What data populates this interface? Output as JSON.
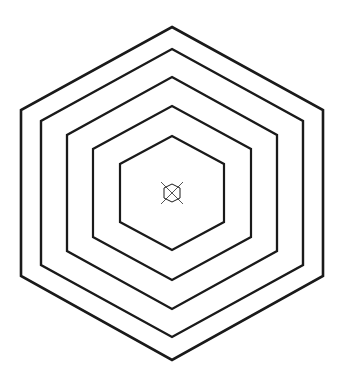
{
  "figure": {
    "background_color": "#ffffff",
    "stroke_color": "#1a1a1a",
    "marker_stroke_color": "#555555",
    "width": 345,
    "height": 387,
    "center": {
      "x": 172,
      "y": 193
    }
  },
  "chart_data": {
    "type": "line",
    "subtitle": "",
    "xlabel": "",
    "ylabel": "",
    "grid": false,
    "legend_position": "none",
    "xlim": [
      0,
      345
    ],
    "ylim": [
      0,
      387
    ],
    "center": {
      "x": 172,
      "y": 193
    },
    "shape": "hexagon",
    "orientation": "pointy-top",
    "ring_count": 5,
    "stroke_width": 2.2,
    "rings": [
      {
        "name": "ring-1-outermost",
        "index": 1,
        "half_width": 151,
        "half_height": 166,
        "stroke_width": 2.6,
        "vertices": [
          {
            "x": 172,
            "y": 27
          },
          {
            "x": 323,
            "y": 110
          },
          {
            "x": 323,
            "y": 276
          },
          {
            "x": 172,
            "y": 360
          },
          {
            "x": 21,
            "y": 276
          },
          {
            "x": 21,
            "y": 110
          }
        ]
      },
      {
        "name": "ring-2",
        "index": 2,
        "half_width": 131,
        "half_height": 144,
        "stroke_width": 2.4,
        "vertices": [
          {
            "x": 172,
            "y": 49
          },
          {
            "x": 303,
            "y": 121
          },
          {
            "x": 303,
            "y": 265
          },
          {
            "x": 172,
            "y": 337
          },
          {
            "x": 41,
            "y": 265
          },
          {
            "x": 41,
            "y": 121
          }
        ]
      },
      {
        "name": "ring-3",
        "index": 3,
        "half_width": 105,
        "half_height": 116,
        "stroke_width": 2.3,
        "vertices": [
          {
            "x": 172,
            "y": 77
          },
          {
            "x": 277,
            "y": 135
          },
          {
            "x": 277,
            "y": 251
          },
          {
            "x": 172,
            "y": 309
          },
          {
            "x": 67,
            "y": 251
          },
          {
            "x": 67,
            "y": 135
          }
        ]
      },
      {
        "name": "ring-4",
        "index": 4,
        "half_width": 79,
        "half_height": 87,
        "stroke_width": 2.2,
        "vertices": [
          {
            "x": 172,
            "y": 106
          },
          {
            "x": 251,
            "y": 149
          },
          {
            "x": 251,
            "y": 237
          },
          {
            "x": 172,
            "y": 280
          },
          {
            "x": 93,
            "y": 237
          },
          {
            "x": 93,
            "y": 149
          }
        ]
      },
      {
        "name": "ring-5-innermost",
        "index": 5,
        "half_width": 52,
        "half_height": 57,
        "stroke_width": 2.2,
        "vertices": [
          {
            "x": 172,
            "y": 136
          },
          {
            "x": 224,
            "y": 164
          },
          {
            "x": 224,
            "y": 222
          },
          {
            "x": 172,
            "y": 250
          },
          {
            "x": 120,
            "y": 222
          },
          {
            "x": 120,
            "y": 164
          }
        ]
      }
    ],
    "center_marker": {
      "name": "crossed-hexagon-marker",
      "shape": "hexagon",
      "half_width": 8,
      "half_height": 9,
      "stroke_width": 1.0,
      "cross_extent": 15,
      "vertices": [
        {
          "x": 172,
          "y": 184
        },
        {
          "x": 180,
          "y": 188
        },
        {
          "x": 180,
          "y": 198
        },
        {
          "x": 172,
          "y": 202
        },
        {
          "x": 164,
          "y": 198
        },
        {
          "x": 164,
          "y": 188
        }
      ],
      "cross_lines": [
        {
          "x1": 161,
          "y1": 182,
          "x2": 183,
          "y2": 204
        },
        {
          "x1": 183,
          "y1": 182,
          "x2": 161,
          "y2": 204
        }
      ]
    }
  }
}
